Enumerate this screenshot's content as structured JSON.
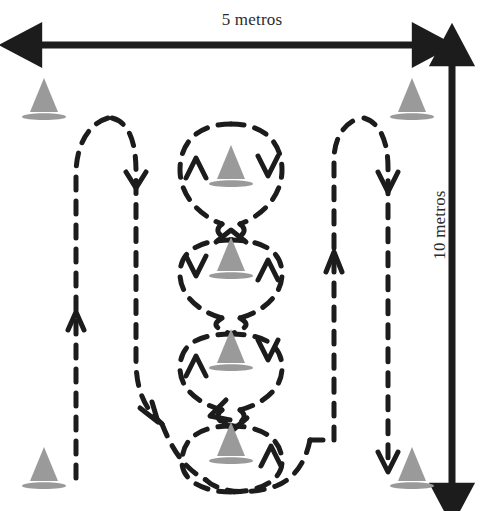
{
  "diagram": {
    "title_width_label": "5 metros",
    "title_height_label": "10 metros",
    "colors": {
      "cone_fill": "#9a9a9a",
      "cone_stroke": "#8a8a8a",
      "path_stroke": "#1c1c1c",
      "dimension_arrow": "#1c1c1c",
      "background": "#ffffff",
      "text": "#2b2b2b"
    },
    "dimensions": {
      "width": {
        "label": "5 metros",
        "orientation": "horizontal",
        "arrow_style": "double-headed",
        "x_start": 38,
        "x_end": 416,
        "y": 45
      },
      "height": {
        "label": "10 metros",
        "orientation": "vertical",
        "arrow_style": "double-headed",
        "y_start": 60,
        "y_end": 487,
        "x": 452
      }
    },
    "cones": [
      {
        "name": "cone-corner-top-left",
        "x": 44,
        "y": 118,
        "group": "corner"
      },
      {
        "name": "cone-corner-top-right",
        "x": 412,
        "y": 118,
        "group": "corner"
      },
      {
        "name": "cone-corner-bottom-left",
        "x": 44,
        "y": 487,
        "group": "corner"
      },
      {
        "name": "cone-corner-bottom-right",
        "x": 412,
        "y": 487,
        "group": "corner"
      },
      {
        "name": "cone-center-1",
        "x": 231,
        "y": 185,
        "group": "center"
      },
      {
        "name": "cone-center-2",
        "x": 231,
        "y": 277,
        "group": "center"
      },
      {
        "name": "cone-center-3",
        "x": 231,
        "y": 369,
        "group": "center"
      },
      {
        "name": "cone-center-4",
        "x": 231,
        "y": 462,
        "group": "center"
      }
    ],
    "path": {
      "style": "dashed",
      "dash_pattern": "13 11",
      "stroke_width": 5,
      "segments": [
        {
          "name": "left-loop",
          "description": "tall narrow loop down the left side"
        },
        {
          "name": "center-weave",
          "description": "alternating ovals around the four center cones"
        },
        {
          "name": "right-loop",
          "description": "tall narrow loop down the right side"
        },
        {
          "name": "bottom-outer-loop",
          "description": "wide arc around the bottom center cone"
        }
      ]
    },
    "arrows": [
      {
        "name": "arrow-left-loop-down",
        "x": 134,
        "y": 183,
        "direction": "down"
      },
      {
        "name": "arrow-left-loop-up",
        "x": 62,
        "y": 317,
        "direction": "up"
      },
      {
        "name": "arrow-left-loop-descend",
        "x": 152,
        "y": 412,
        "direction": "down-right"
      },
      {
        "name": "arrow-center-1-left-up",
        "x": 196,
        "y": 163,
        "direction": "up"
      },
      {
        "name": "arrow-center-1-right-down",
        "x": 268,
        "y": 163,
        "direction": "down"
      },
      {
        "name": "arrow-center-2-left-down",
        "x": 196,
        "y": 265,
        "direction": "down"
      },
      {
        "name": "arrow-center-2-right-up",
        "x": 268,
        "y": 265,
        "direction": "up"
      },
      {
        "name": "arrow-center-3-left-up",
        "x": 196,
        "y": 357,
        "direction": "up"
      },
      {
        "name": "arrow-center-3-right-down",
        "x": 268,
        "y": 347,
        "direction": "down"
      },
      {
        "name": "arrow-center-4-left-down",
        "x": 212,
        "y": 412,
        "direction": "down-left"
      },
      {
        "name": "arrow-center-4-right-up",
        "x": 271,
        "y": 452,
        "direction": "up"
      },
      {
        "name": "arrow-right-loop-down",
        "x": 383,
        "y": 183,
        "direction": "down"
      },
      {
        "name": "arrow-right-loop-up",
        "x": 327,
        "y": 260,
        "direction": "up"
      },
      {
        "name": "arrow-right-loop-exit",
        "x": 374,
        "y": 474,
        "direction": "down"
      }
    ]
  }
}
